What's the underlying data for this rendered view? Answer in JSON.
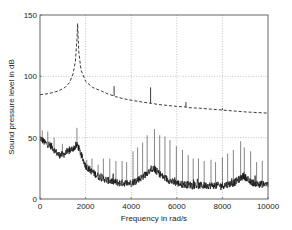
{
  "chart_data": {
    "type": "line",
    "title": "",
    "xlabel": "Frequency in rad/s",
    "ylabel": "Sound pressure level in dB",
    "xlim": [
      0,
      10000
    ],
    "ylim": [
      0,
      150
    ],
    "xticks": [
      0,
      2000,
      4000,
      6000,
      8000,
      10000
    ],
    "xtick_labels": [
      "0",
      "2000",
      "4000",
      "6000",
      "8000",
      "10000"
    ],
    "yticks": [
      0,
      50,
      100,
      150
    ],
    "ytick_labels": [
      "0",
      "50",
      "100",
      "150"
    ],
    "grid": true,
    "legend": null,
    "series": [
      {
        "name": "dashed resonance curve",
        "style": "dashed",
        "x": [
          0,
          400,
          800,
          1100,
          1300,
          1450,
          1550,
          1620,
          1650,
          1700,
          1800,
          2000,
          2300,
          2700,
          3000,
          3250,
          3300,
          3600,
          4000,
          4500,
          4850,
          4900,
          5200,
          6000,
          6400,
          6500,
          7000,
          8000,
          9000,
          10000
        ],
        "values": [
          85,
          86,
          88,
          91,
          95,
          102,
          112,
          130,
          143,
          120,
          105,
          96,
          91,
          88,
          85.5,
          84,
          83.5,
          82,
          80.5,
          79,
          78,
          78,
          77,
          75.5,
          75,
          74.5,
          74,
          72.5,
          71,
          70
        ],
        "spikes": [
          {
            "x": 3250,
            "top": 92
          },
          {
            "x": 4850,
            "top": 91
          },
          {
            "x": 6400,
            "top": 79
          },
          {
            "x": 8000,
            "top": 74
          }
        ]
      },
      {
        "name": "measured spectrum (noisy)",
        "style": "solid",
        "baseline_x": [
          0,
          200,
          500,
          800,
          1000,
          1200,
          1500,
          1650,
          1800,
          2000,
          2300,
          2600,
          3000,
          3500,
          4000,
          4500,
          4900,
          5100,
          5400,
          5800,
          6200,
          7000,
          7500,
          8000,
          8500,
          8800,
          8950,
          9200,
          9600,
          10000
        ],
        "baseline_values": [
          50,
          46,
          43,
          36,
          36,
          38,
          42,
          44,
          36,
          27,
          22,
          18,
          15,
          13,
          13,
          18,
          25,
          23,
          18,
          14,
          12,
          11,
          11,
          11,
          13,
          17,
          19,
          14,
          12,
          12
        ],
        "noise_amplitude": 3,
        "peaks_x": [
          100,
          340,
          620,
          980,
          1620,
          1760,
          2050,
          2280,
          2550,
          2780,
          3060,
          3330,
          3600,
          3800,
          4080,
          4280,
          4500,
          4700,
          5020,
          5250,
          5480,
          5700,
          5980,
          6250,
          6500,
          6720,
          6950,
          7200,
          7500,
          7700,
          8000,
          8230,
          8480,
          8800,
          8960,
          9240,
          9500,
          9750
        ],
        "peaks_values": [
          56,
          55,
          50,
          45,
          58,
          40,
          32,
          33,
          28,
          33,
          33,
          31,
          31,
          30,
          39,
          42,
          46,
          52,
          57,
          52,
          51,
          48,
          43,
          40,
          36,
          33,
          33,
          31,
          32,
          30,
          34,
          37,
          40,
          47,
          42,
          39,
          30,
          31
        ]
      }
    ]
  }
}
